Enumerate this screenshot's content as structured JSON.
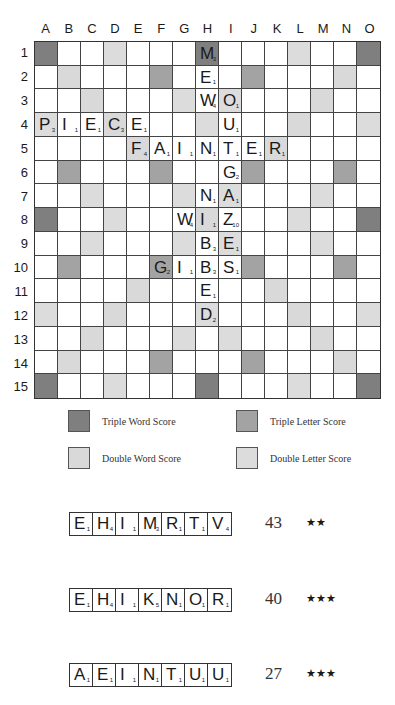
{
  "board": {
    "columns": [
      "A",
      "B",
      "C",
      "D",
      "E",
      "F",
      "G",
      "H",
      "I",
      "J",
      "K",
      "L",
      "M",
      "N",
      "O"
    ],
    "rows": [
      "1",
      "2",
      "3",
      "4",
      "5",
      "6",
      "7",
      "8",
      "9",
      "10",
      "11",
      "12",
      "13",
      "14",
      "15"
    ],
    "premium_layout": [
      [
        "TW",
        "",
        "",
        "DL",
        "",
        "",
        "",
        "TW",
        "",
        "",
        "",
        "DL",
        "",
        "",
        "TW"
      ],
      [
        "",
        "DW",
        "",
        "",
        "",
        "TL",
        "",
        "",
        "",
        "TL",
        "",
        "",
        "",
        "DW",
        ""
      ],
      [
        "",
        "",
        "DW",
        "",
        "",
        "",
        "DL",
        "",
        "DL",
        "",
        "",
        "",
        "DW",
        "",
        ""
      ],
      [
        "DL",
        "",
        "",
        "DW",
        "",
        "",
        "",
        "DL",
        "",
        "",
        "",
        "DW",
        "",
        "",
        "DL"
      ],
      [
        "",
        "",
        "",
        "",
        "DW",
        "",
        "",
        "",
        "",
        "",
        "DW",
        "",
        "",
        "",
        ""
      ],
      [
        "",
        "TL",
        "",
        "",
        "",
        "TL",
        "",
        "",
        "",
        "TL",
        "",
        "",
        "",
        "TL",
        ""
      ],
      [
        "",
        "",
        "DL",
        "",
        "",
        "",
        "DL",
        "",
        "DL",
        "",
        "",
        "",
        "DL",
        "",
        ""
      ],
      [
        "TW",
        "",
        "",
        "DL",
        "",
        "",
        "",
        "DW",
        "",
        "",
        "",
        "DL",
        "",
        "",
        "TW"
      ],
      [
        "",
        "",
        "DL",
        "",
        "",
        "",
        "DL",
        "",
        "DL",
        "",
        "",
        "",
        "DL",
        "",
        ""
      ],
      [
        "",
        "TL",
        "",
        "",
        "",
        "TL",
        "",
        "",
        "",
        "TL",
        "",
        "",
        "",
        "TL",
        ""
      ],
      [
        "",
        "",
        "",
        "",
        "DW",
        "",
        "",
        "",
        "",
        "",
        "DW",
        "",
        "",
        "",
        ""
      ],
      [
        "DL",
        "",
        "",
        "DW",
        "",
        "",
        "",
        "DL",
        "",
        "",
        "",
        "DW",
        "",
        "",
        "DL"
      ],
      [
        "",
        "",
        "DW",
        "",
        "",
        "",
        "DL",
        "",
        "DL",
        "",
        "",
        "",
        "DW",
        "",
        ""
      ],
      [
        "",
        "DW",
        "",
        "",
        "",
        "TL",
        "",
        "",
        "",
        "TL",
        "",
        "",
        "",
        "DW",
        ""
      ],
      [
        "TW",
        "",
        "",
        "DL",
        "",
        "",
        "",
        "TW",
        "",
        "",
        "",
        "DL",
        "",
        "",
        "TW"
      ]
    ],
    "tiles": [
      {
        "row": 1,
        "col": "H",
        "letter": "M",
        "value": "3"
      },
      {
        "row": 2,
        "col": "H",
        "letter": "E",
        "value": "1"
      },
      {
        "row": 3,
        "col": "H",
        "letter": "W",
        "value": "4"
      },
      {
        "row": 3,
        "col": "I",
        "letter": "O",
        "value": "1"
      },
      {
        "row": 4,
        "col": "A",
        "letter": "P",
        "value": "3"
      },
      {
        "row": 4,
        "col": "B",
        "letter": "I",
        "value": "1"
      },
      {
        "row": 4,
        "col": "C",
        "letter": "E",
        "value": "1"
      },
      {
        "row": 4,
        "col": "D",
        "letter": "C",
        "value": "3"
      },
      {
        "row": 4,
        "col": "E",
        "letter": "E",
        "value": "1"
      },
      {
        "row": 4,
        "col": "I",
        "letter": "U",
        "value": "1"
      },
      {
        "row": 5,
        "col": "E",
        "letter": "F",
        "value": "4"
      },
      {
        "row": 5,
        "col": "F",
        "letter": "A",
        "value": "1"
      },
      {
        "row": 5,
        "col": "G",
        "letter": "I",
        "value": "1"
      },
      {
        "row": 5,
        "col": "H",
        "letter": "N",
        "value": "1"
      },
      {
        "row": 5,
        "col": "I",
        "letter": "T",
        "value": "1"
      },
      {
        "row": 5,
        "col": "J",
        "letter": "E",
        "value": "1"
      },
      {
        "row": 5,
        "col": "K",
        "letter": "R",
        "value": "1"
      },
      {
        "row": 6,
        "col": "I",
        "letter": "G",
        "value": "2"
      },
      {
        "row": 7,
        "col": "H",
        "letter": "N",
        "value": "1"
      },
      {
        "row": 7,
        "col": "I",
        "letter": "A",
        "value": "1"
      },
      {
        "row": 8,
        "col": "G",
        "letter": "W",
        "value": "4"
      },
      {
        "row": 8,
        "col": "H",
        "letter": "I",
        "value": "1"
      },
      {
        "row": 8,
        "col": "I",
        "letter": "Z",
        "value": "10"
      },
      {
        "row": 9,
        "col": "H",
        "letter": "B",
        "value": "3"
      },
      {
        "row": 9,
        "col": "I",
        "letter": "E",
        "value": "1"
      },
      {
        "row": 10,
        "col": "F",
        "letter": "G",
        "value": "2"
      },
      {
        "row": 10,
        "col": "G",
        "letter": "I",
        "value": "1"
      },
      {
        "row": 10,
        "col": "H",
        "letter": "B",
        "value": "3"
      },
      {
        "row": 10,
        "col": "I",
        "letter": "S",
        "value": "1"
      },
      {
        "row": 11,
        "col": "H",
        "letter": "E",
        "value": "1"
      },
      {
        "row": 12,
        "col": "H",
        "letter": "D",
        "value": "2"
      }
    ]
  },
  "colors": {
    "TW": "#7f7f7f",
    "TL": "#a3a3a3",
    "DW": "#d9d9d9",
    "DL": "#dcdcdc"
  },
  "legend": {
    "triple_word": "Triple Word Score",
    "triple_letter": "Triple Letter Score",
    "double_word": "Double Word Score",
    "double_letter": "Double Letter Score"
  },
  "racks": [
    {
      "tiles": [
        {
          "letter": "E",
          "value": "1"
        },
        {
          "letter": "H",
          "value": "4"
        },
        {
          "letter": "I",
          "value": "1"
        },
        {
          "letter": "M",
          "value": "3"
        },
        {
          "letter": "R",
          "value": "1"
        },
        {
          "letter": "T",
          "value": "1"
        },
        {
          "letter": "V",
          "value": "4"
        }
      ],
      "score": "43",
      "stars": "★★"
    },
    {
      "tiles": [
        {
          "letter": "E",
          "value": "1"
        },
        {
          "letter": "H",
          "value": "4"
        },
        {
          "letter": "I",
          "value": "1"
        },
        {
          "letter": "K",
          "value": "5"
        },
        {
          "letter": "N",
          "value": "1"
        },
        {
          "letter": "O",
          "value": "1"
        },
        {
          "letter": "R",
          "value": "1"
        }
      ],
      "score": "40",
      "stars": "★★★"
    },
    {
      "tiles": [
        {
          "letter": "A",
          "value": "1"
        },
        {
          "letter": "E",
          "value": "1"
        },
        {
          "letter": "I",
          "value": "1"
        },
        {
          "letter": "N",
          "value": "1"
        },
        {
          "letter": "T",
          "value": "1"
        },
        {
          "letter": "U",
          "value": "1"
        },
        {
          "letter": "U",
          "value": "1"
        }
      ],
      "score": "27",
      "stars": "★★★"
    }
  ]
}
